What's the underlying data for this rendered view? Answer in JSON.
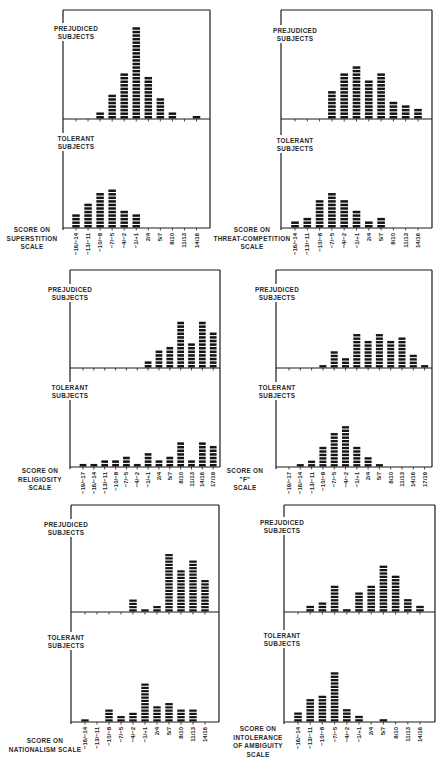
{
  "figure": {
    "colors": {
      "bar": "#141414",
      "axis": "#1a1a1a",
      "background": "#ffffff",
      "text": "#2a2a2a"
    },
    "group_labels": {
      "prejudiced": [
        "PREJUDICED",
        "SUBJECTS"
      ],
      "tolerant": [
        "TOLERANT",
        "SUBJECTS"
      ]
    }
  },
  "chart_data": [
    {
      "type": "bar",
      "title": "Superstition",
      "xlabel": [
        "SCORE ON",
        "SUPERSTITION",
        "SCALE"
      ],
      "ylabel": "",
      "categories": [
        "-16/-14",
        "-13/-11",
        "-10/-8",
        "-7/-5",
        "-4/-2",
        "-1/+1",
        "2/4",
        "5/7",
        "8/10",
        "11/13",
        "14/16"
      ],
      "series": [
        {
          "name": "Prejudiced Subjects",
          "values": [
            0,
            0,
            2,
            7,
            13,
            26,
            12,
            6,
            2,
            0,
            1
          ]
        },
        {
          "name": "Tolerant Subjects",
          "values": [
            4,
            7,
            10,
            11,
            5,
            4,
            0,
            0,
            0,
            0,
            0
          ]
        }
      ],
      "grid": false
    },
    {
      "type": "bar",
      "title": "Threat-Competition",
      "xlabel": [
        "SCORE ON",
        "THREAT-COMPETITION",
        "SCALE"
      ],
      "ylabel": "",
      "categories": [
        "-16/-14",
        "-13/-11",
        "-10/-8",
        "-7/-5",
        "-4/-2",
        "-1/+1",
        "2/4",
        "5/7",
        "8/10",
        "11/13",
        "14/16"
      ],
      "series": [
        {
          "name": "Prejudiced Subjects",
          "values": [
            0,
            0,
            0,
            8,
            13,
            15,
            11,
            13,
            5,
            4,
            3
          ]
        },
        {
          "name": "Tolerant Subjects",
          "values": [
            2,
            3,
            8,
            10,
            8,
            5,
            2,
            3,
            0,
            0,
            0
          ]
        }
      ],
      "grid": false
    },
    {
      "type": "bar",
      "title": "Religiosity",
      "xlabel": [
        "SCORE ON",
        "RELIGIOSITY",
        "SCALE"
      ],
      "ylabel": "",
      "categories": [
        "-19/-17",
        "-16/-14",
        "-13/-11",
        "-10/-8",
        "-7/-5",
        "-4/-2",
        "-1/+1",
        "2/4",
        "5/7",
        "8/10",
        "11/13",
        "14/16",
        "17/19"
      ],
      "series": [
        {
          "name": "Prejudiced Subjects",
          "values": [
            0,
            0,
            0,
            0,
            0,
            0,
            2,
            5,
            6,
            13,
            7,
            13,
            10
          ]
        },
        {
          "name": "Tolerant Subjects",
          "values": [
            1,
            1,
            2,
            2,
            3,
            1,
            4,
            2,
            3,
            7,
            2,
            7,
            6
          ]
        }
      ],
      "grid": false
    },
    {
      "type": "bar",
      "title": "F",
      "xlabel": [
        "SCORE ON",
        "\"F\"",
        "SCALE"
      ],
      "ylabel": "",
      "categories": [
        "-19/-17",
        "-16/-14",
        "-13/-11",
        "-10/-8",
        "-7/-5",
        "-4/-2",
        "-1/+1",
        "2/4",
        "5/7",
        "8/10",
        "11/13",
        "14/16",
        "17/19"
      ],
      "series": [
        {
          "name": "Prejudiced Subjects",
          "values": [
            0,
            0,
            0,
            1,
            5,
            3,
            10,
            8,
            10,
            8,
            9,
            4,
            1
          ]
        },
        {
          "name": "Tolerant Subjects",
          "values": [
            0,
            1,
            2,
            6,
            10,
            12,
            6,
            3,
            1,
            0,
            0,
            0,
            0
          ]
        }
      ],
      "grid": false
    },
    {
      "type": "bar",
      "title": "Nationalism",
      "xlabel": [
        "SCORE ON",
        "NATIONALISM SCALE"
      ],
      "ylabel": "",
      "categories": [
        "-16/-14",
        "-13/-11",
        "-10/-8",
        "-7/-5",
        "-4/-2",
        "-1/+1",
        "2/4",
        "5/7",
        "8/10",
        "11/13",
        "14/16"
      ],
      "series": [
        {
          "name": "Prejudiced Subjects",
          "values": [
            0,
            0,
            0,
            0,
            4,
            1,
            2,
            18,
            13,
            16,
            10
          ]
        },
        {
          "name": "Tolerant Subjects",
          "values": [
            1,
            0,
            4,
            2,
            3,
            12,
            5,
            6,
            4,
            4,
            0
          ]
        }
      ],
      "grid": false
    },
    {
      "type": "bar",
      "title": "Intolerance of Ambiguity",
      "xlabel": [
        "SCORE ON",
        "INTOLERANCE",
        "OF AMBIGUITY",
        "SCALE"
      ],
      "ylabel": "",
      "categories": [
        "-16/-14",
        "-13/-11",
        "-10/-8",
        "-7/-5",
        "-4/-2",
        "-1/+1",
        "2/4",
        "5/7",
        "8/10",
        "11/13",
        "14/16"
      ],
      "series": [
        {
          "name": "Prejudiced Subjects",
          "values": [
            0,
            2,
            3,
            8,
            1,
            6,
            8,
            14,
            11,
            4,
            2
          ]
        },
        {
          "name": "Tolerant Subjects",
          "values": [
            3,
            7,
            8,
            15,
            4,
            2,
            0,
            1,
            0,
            0,
            0
          ]
        }
      ],
      "grid": false
    }
  ]
}
